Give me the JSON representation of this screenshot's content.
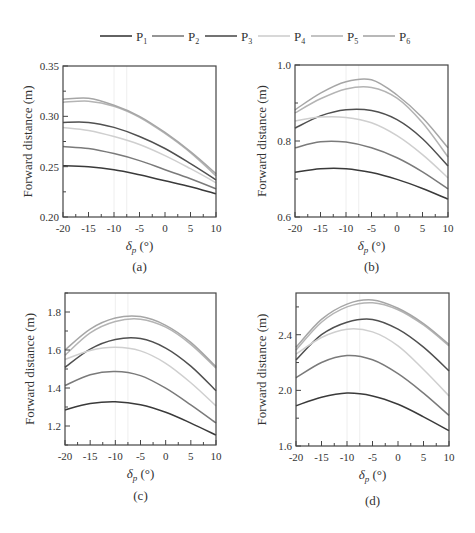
{
  "figure": {
    "legend": [
      {
        "label": "P",
        "sub": "1",
        "color": "#3a3a3a"
      },
      {
        "label": "P",
        "sub": "2",
        "color": "#7a7a7a"
      },
      {
        "label": "P",
        "sub": "3",
        "color": "#505050"
      },
      {
        "label": "P",
        "sub": "4",
        "color": "#cfcfcf"
      },
      {
        "label": "P",
        "sub": "5",
        "color": "#b4b4b4"
      },
      {
        "label": "P",
        "sub": "6",
        "color": "#a6a6a6"
      }
    ]
  },
  "chart_data": [
    {
      "type": "line",
      "panel_label": "(a)",
      "xlabel": "δp (°)",
      "ylabel": "Forward distance (m)",
      "xlim": [
        -20,
        10
      ],
      "ylim": [
        0.2,
        0.35
      ],
      "xticks": [
        -20,
        -15,
        -10,
        -5,
        0,
        5,
        10
      ],
      "yticks": [
        "0.20",
        "0.25",
        "0.30",
        "0.35"
      ],
      "ytick_values": [
        0.2,
        0.25,
        0.3,
        0.35
      ],
      "x": [
        -20,
        -15,
        -10,
        -5,
        0,
        5,
        10
      ],
      "series": [
        {
          "name": "P1",
          "values": [
            0.251,
            0.25,
            0.247,
            0.242,
            0.236,
            0.23,
            0.223
          ]
        },
        {
          "name": "P2",
          "values": [
            0.27,
            0.268,
            0.263,
            0.256,
            0.247,
            0.238,
            0.228
          ]
        },
        {
          "name": "P3",
          "values": [
            0.294,
            0.294,
            0.289,
            0.28,
            0.268,
            0.253,
            0.237
          ]
        },
        {
          "name": "P4",
          "values": [
            0.289,
            0.286,
            0.28,
            0.272,
            0.261,
            0.248,
            0.234
          ]
        },
        {
          "name": "P5",
          "values": [
            0.314,
            0.315,
            0.31,
            0.299,
            0.283,
            0.264,
            0.241
          ]
        },
        {
          "name": "P6",
          "values": [
            0.317,
            0.318,
            0.311,
            0.3,
            0.284,
            0.265,
            0.243
          ]
        }
      ]
    },
    {
      "type": "line",
      "panel_label": "(b)",
      "xlabel": "δp (°)",
      "ylabel": "Forward distance (m)",
      "xlim": [
        -20,
        10
      ],
      "ylim": [
        0.6,
        1.0
      ],
      "xticks": [
        -20,
        -15,
        -10,
        -5,
        0,
        5,
        10
      ],
      "yticks": [
        "0.6",
        "0.8",
        "1.0"
      ],
      "ytick_values": [
        0.6,
        0.8,
        1.0
      ],
      "x": [
        -20,
        -15,
        -10,
        -5,
        0,
        5,
        10
      ],
      "series": [
        {
          "name": "P1",
          "values": [
            0.718,
            0.727,
            0.727,
            0.717,
            0.699,
            0.675,
            0.647
          ]
        },
        {
          "name": "P2",
          "values": [
            0.782,
            0.798,
            0.797,
            0.782,
            0.756,
            0.719,
            0.674
          ]
        },
        {
          "name": "P3",
          "values": [
            0.834,
            0.866,
            0.882,
            0.88,
            0.856,
            0.806,
            0.734
          ]
        },
        {
          "name": "P4",
          "values": [
            0.853,
            0.863,
            0.862,
            0.848,
            0.814,
            0.764,
            0.703
          ]
        },
        {
          "name": "P5",
          "values": [
            0.874,
            0.911,
            0.937,
            0.941,
            0.913,
            0.848,
            0.758
          ]
        },
        {
          "name": "P6",
          "values": [
            0.882,
            0.926,
            0.956,
            0.961,
            0.921,
            0.861,
            0.782
          ]
        }
      ]
    },
    {
      "type": "line",
      "panel_label": "(c)",
      "xlabel": "δp (°)",
      "ylabel": "Forward distance (m)",
      "xlim": [
        -20,
        10
      ],
      "ylim": [
        1.1,
        1.9
      ],
      "xticks": [
        -20,
        -15,
        -10,
        -5,
        0,
        5,
        10
      ],
      "yticks": [
        "1.2",
        "1.4",
        "1.6",
        "1.8"
      ],
      "ytick_values": [
        1.2,
        1.4,
        1.6,
        1.8
      ],
      "x": [
        -20,
        -15,
        -10,
        -5,
        0,
        5,
        10
      ],
      "series": [
        {
          "name": "P1",
          "values": [
            1.285,
            1.318,
            1.328,
            1.312,
            1.272,
            1.215,
            1.152
          ]
        },
        {
          "name": "P2",
          "values": [
            1.413,
            1.47,
            1.487,
            1.465,
            1.399,
            1.311,
            1.216
          ]
        },
        {
          "name": "P3",
          "values": [
            1.509,
            1.605,
            1.655,
            1.66,
            1.61,
            1.515,
            1.386
          ]
        },
        {
          "name": "P4",
          "values": [
            1.55,
            1.598,
            1.614,
            1.595,
            1.53,
            1.428,
            1.306
          ]
        },
        {
          "name": "P5",
          "values": [
            1.572,
            1.69,
            1.75,
            1.762,
            1.72,
            1.63,
            1.505
          ]
        },
        {
          "name": "P6",
          "values": [
            1.6,
            1.71,
            1.768,
            1.776,
            1.73,
            1.64,
            1.512
          ]
        }
      ]
    },
    {
      "type": "line",
      "panel_label": "(d)",
      "xlabel": "δp (°)",
      "ylabel": "Forward distance (m)",
      "xlim": [
        -20,
        10
      ],
      "ylim": [
        1.6,
        2.7
      ],
      "xticks": [
        -20,
        -15,
        -10,
        -5,
        0,
        5,
        10
      ],
      "yticks": [
        "1.6",
        "2.0",
        "2.4"
      ],
      "ytick_values": [
        1.6,
        2.0,
        2.4
      ],
      "x": [
        -20,
        -15,
        -10,
        -5,
        0,
        5,
        10
      ],
      "series": [
        {
          "name": "P1",
          "values": [
            1.89,
            1.95,
            1.98,
            1.96,
            1.9,
            1.81,
            1.71
          ]
        },
        {
          "name": "P2",
          "values": [
            2.09,
            2.2,
            2.25,
            2.22,
            2.12,
            1.98,
            1.82
          ]
        },
        {
          "name": "P3",
          "values": [
            2.22,
            2.4,
            2.49,
            2.51,
            2.44,
            2.31,
            2.14
          ]
        },
        {
          "name": "P4",
          "values": [
            2.26,
            2.38,
            2.44,
            2.42,
            2.32,
            2.15,
            1.96
          ]
        },
        {
          "name": "P5",
          "values": [
            2.29,
            2.49,
            2.6,
            2.63,
            2.58,
            2.47,
            2.32
          ]
        },
        {
          "name": "P6",
          "values": [
            2.31,
            2.51,
            2.62,
            2.65,
            2.59,
            2.48,
            2.33
          ]
        }
      ]
    }
  ]
}
